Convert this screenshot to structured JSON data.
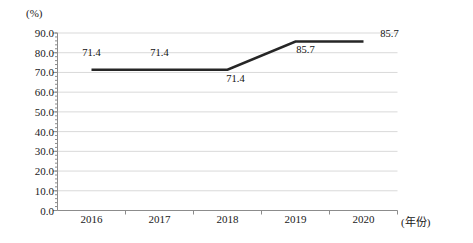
{
  "chart_data": {
    "type": "line",
    "title": "",
    "subtitle": "",
    "xlabel": "(年份)",
    "ylabel": "(%)",
    "categories": [
      "2016",
      "2017",
      "2018",
      "2019",
      "2020"
    ],
    "values": [
      71.4,
      71.4,
      71.4,
      85.7,
      85.7
    ],
    "series": [
      {
        "name": "",
        "values": [
          71.4,
          71.4,
          71.4,
          85.7,
          85.7
        ],
        "color": "#262626"
      }
    ],
    "data_labels": [
      "71.4",
      "71.4",
      "71.4",
      "85.7",
      "85.7"
    ],
    "ylim": [
      0.0,
      90.0
    ],
    "ytick_labels": [
      "0.0",
      "10.0",
      "20.0",
      "30.0",
      "40.0",
      "50.0",
      "60.0",
      "70.0",
      "80.0",
      "90.0"
    ],
    "ytick_values": [
      0.0,
      10.0,
      20.0,
      30.0,
      40.0,
      50.0,
      60.0,
      70.0,
      80.0,
      90.0
    ],
    "ytick_step": 10.0,
    "yminor_step": 2.0,
    "grid": true,
    "grid_axis": "y",
    "grid_color": "#d9d9d9",
    "legend": false,
    "legend_position": "none",
    "axis_color": "#808080",
    "line_width": 2.6
  },
  "axis": {
    "unit_label": "(%)",
    "x_axis_name": "(年份)"
  }
}
